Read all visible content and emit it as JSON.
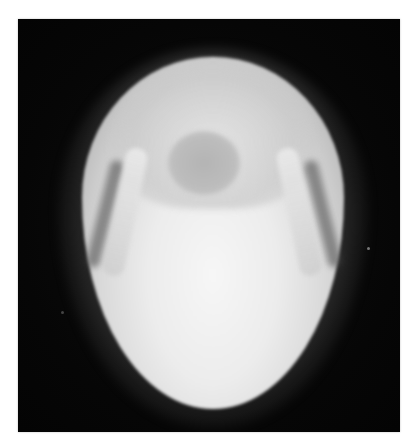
{
  "image": {
    "subject": "skull radiograph",
    "view": "submentovertex (basal) X-ray",
    "background_color": "#ffffff",
    "film_color": "#080808",
    "bone_color": "#eeeeee"
  }
}
